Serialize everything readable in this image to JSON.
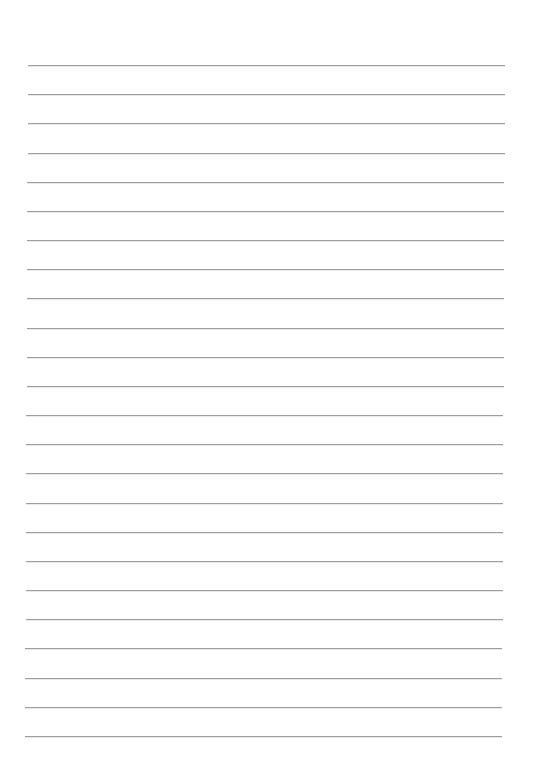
{
  "document": {
    "type": "lined-paper",
    "line_count": 24,
    "line_color": "#9e9e9e",
    "background_color": "#ffffff",
    "text": ""
  }
}
